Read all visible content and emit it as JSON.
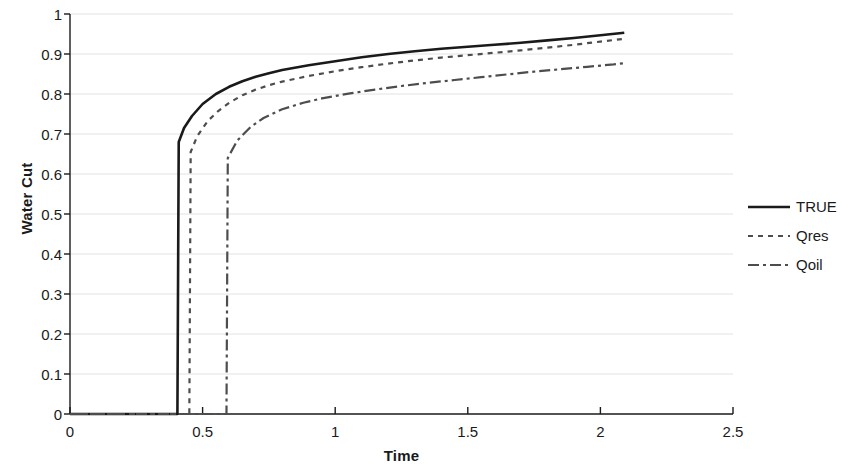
{
  "chart_data": {
    "type": "line",
    "title": "",
    "xlabel": "Time",
    "ylabel": "Water Cut",
    "xlim": [
      0,
      2.5
    ],
    "ylim": [
      0,
      1
    ],
    "grid": true,
    "grid_axis": "y",
    "legend_position": "right",
    "xticks": [
      "0",
      "0.5",
      "1",
      "1.5",
      "2",
      "2.5"
    ],
    "xtick_values": [
      0,
      0.5,
      1,
      1.5,
      2,
      2.5
    ],
    "yticks": [
      "0",
      "0.1",
      "0.2",
      "0.3",
      "0.4",
      "0.5",
      "0.6",
      "0.7",
      "0.8",
      "0.9",
      "1"
    ],
    "ytick_values": [
      0,
      0.1,
      0.2,
      0.3,
      0.4,
      0.5,
      0.6,
      0.7,
      0.8,
      0.9,
      1
    ],
    "series": [
      {
        "name": "TRUE",
        "style": "solid",
        "color": "#1a1a1a",
        "breakthrough_time": 0.41,
        "breakthrough_value": 0.68,
        "x": [
          0.0,
          0.05,
          0.1,
          0.15,
          0.2,
          0.25,
          0.3,
          0.35,
          0.405,
          0.41,
          0.43,
          0.46,
          0.5,
          0.55,
          0.6,
          0.65,
          0.7,
          0.75,
          0.8,
          0.9,
          1.0,
          1.1,
          1.2,
          1.3,
          1.4,
          1.5,
          1.6,
          1.7,
          1.8,
          1.9,
          2.0,
          2.09
        ],
        "y": [
          0.0,
          0.0,
          0.0,
          0.0,
          0.0,
          0.0,
          0.0,
          0.0,
          0.0,
          0.68,
          0.715,
          0.745,
          0.775,
          0.8,
          0.818,
          0.832,
          0.843,
          0.852,
          0.86,
          0.872,
          0.882,
          0.892,
          0.9,
          0.907,
          0.913,
          0.918,
          0.923,
          0.928,
          0.934,
          0.94,
          0.947,
          0.953
        ]
      },
      {
        "name": "Qres",
        "style": "dashed",
        "color": "#4d4d4d",
        "breakthrough_time": 0.455,
        "breakthrough_value": 0.655,
        "x": [
          0.0,
          0.05,
          0.1,
          0.15,
          0.2,
          0.25,
          0.3,
          0.35,
          0.4,
          0.45,
          0.455,
          0.48,
          0.52,
          0.56,
          0.6,
          0.65,
          0.7,
          0.75,
          0.8,
          0.9,
          1.0,
          1.1,
          1.2,
          1.3,
          1.4,
          1.5,
          1.6,
          1.7,
          1.8,
          1.9,
          2.0,
          2.09
        ],
        "y": [
          0.0,
          0.0,
          0.0,
          0.0,
          0.0,
          0.0,
          0.0,
          0.0,
          0.0,
          0.0,
          0.655,
          0.695,
          0.733,
          0.758,
          0.778,
          0.797,
          0.811,
          0.822,
          0.831,
          0.845,
          0.857,
          0.867,
          0.876,
          0.884,
          0.891,
          0.897,
          0.903,
          0.909,
          0.916,
          0.923,
          0.931,
          0.938
        ]
      },
      {
        "name": "Qoil",
        "style": "dashdot",
        "color": "#4d4d4d",
        "breakthrough_time": 0.595,
        "breakthrough_value": 0.64,
        "x": [
          0.0,
          0.05,
          0.1,
          0.15,
          0.2,
          0.25,
          0.3,
          0.35,
          0.4,
          0.45,
          0.5,
          0.55,
          0.59,
          0.595,
          0.63,
          0.68,
          0.73,
          0.8,
          0.88,
          0.95,
          1.05,
          1.15,
          1.25,
          1.35,
          1.45,
          1.55,
          1.65,
          1.75,
          1.85,
          1.95,
          2.05,
          2.09
        ],
        "y": [
          0.0,
          0.0,
          0.0,
          0.0,
          0.0,
          0.0,
          0.0,
          0.0,
          0.0,
          0.0,
          0.0,
          0.0,
          0.0,
          0.64,
          0.683,
          0.717,
          0.74,
          0.762,
          0.778,
          0.789,
          0.801,
          0.811,
          0.82,
          0.828,
          0.835,
          0.842,
          0.849,
          0.856,
          0.862,
          0.868,
          0.874,
          0.877
        ]
      }
    ]
  },
  "axes": {
    "ylabel": "Water Cut",
    "xlabel": "Time"
  },
  "legend": {
    "items": [
      {
        "label": "TRUE"
      },
      {
        "label": "Qres"
      },
      {
        "label": "Qoil"
      }
    ]
  },
  "colors": {
    "axis": "#1a1a1a",
    "grid": "#e2e2e2",
    "true_series": "#1a1a1a",
    "qres_series": "#4d4d4d",
    "qoil_series": "#4d4d4d",
    "background": "#ffffff"
  }
}
